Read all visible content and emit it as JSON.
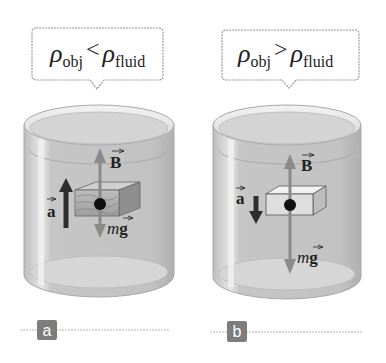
{
  "panels": [
    {
      "id": "a",
      "label": "a",
      "bubble": {
        "rho": "ρ",
        "obj_sub": "obj",
        "relation": "<",
        "fluid_sub": "fluid"
      },
      "object": "wooden block",
      "forces": {
        "buoyant": "B",
        "weight_m": "m",
        "weight_g": "g"
      },
      "acceleration": {
        "symbol": "a",
        "direction": "up"
      }
    },
    {
      "id": "b",
      "label": "b",
      "bubble": {
        "rho": "ρ",
        "obj_sub": "obj",
        "relation": ">",
        "fluid_sub": "fluid"
      },
      "object": "dense block",
      "forces": {
        "buoyant": "B",
        "weight_m": "m",
        "weight_g": "g"
      },
      "acceleration": {
        "symbol": "a",
        "direction": "down"
      }
    }
  ],
  "colors": {
    "fluid": "#c4c4c4",
    "container_rim": "#e6e6e6",
    "force_arrow": "#8a8a8a",
    "accel_arrow": "#2e2e2e",
    "label_box": "#7d7d7d",
    "label_text": "#ffffff",
    "bubble_border": "#9a9a9a"
  }
}
